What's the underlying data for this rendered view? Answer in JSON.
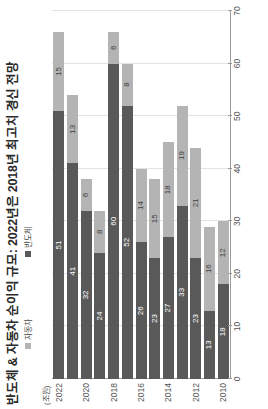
{
  "chart_data": {
    "type": "bar",
    "orientation": "horizontal-stacked",
    "title": "반도체 & 자동차 순이익 규모: 2022년은 2018년 최고치 경신 전망",
    "unit_label": "(조원)",
    "xlabel": "",
    "ylabel": "",
    "categories": [
      "2010",
      "2011",
      "2012",
      "2013",
      "2014",
      "2015",
      "2016",
      "2017",
      "2018",
      "2019",
      "2020",
      "2021",
      "2022"
    ],
    "tick_categories": [
      "2010",
      "2012",
      "2014",
      "2016",
      "2018",
      "2020",
      "2022"
    ],
    "series": [
      {
        "name": "반도체",
        "color": "#595959",
        "values": [
          18,
          13,
          23,
          33,
          27,
          23,
          26,
          52,
          60,
          24,
          32,
          41,
          51
        ]
      },
      {
        "name": "자동차",
        "color": "#b4b4b4",
        "values": [
          12,
          16,
          21,
          19,
          18,
          15,
          14,
          8,
          6,
          8,
          6,
          13,
          15
        ]
      }
    ],
    "totals": [
      30,
      29,
      44,
      52,
      45,
      38,
      40,
      60,
      66,
      32,
      38,
      54,
      66
    ],
    "xlim": [
      0,
      70
    ],
    "xticks": [
      0,
      10,
      20,
      30,
      40,
      50,
      60,
      70
    ],
    "grid": true,
    "legend_position": "top"
  }
}
